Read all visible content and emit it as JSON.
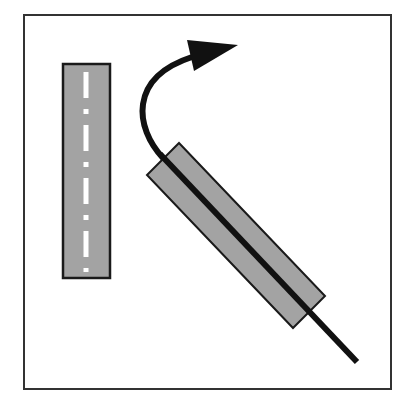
{
  "diagram": {
    "frame": {
      "x": 24,
      "y": 15,
      "width": 367,
      "height": 374,
      "stroke": "#333333",
      "stroke_width": 2
    },
    "colors": {
      "background": "#ffffff",
      "road_fill": "#a3a3a3",
      "road_stroke": "#1a1a1a",
      "center_marking": "#ffffff",
      "path_line": "#111111"
    },
    "straight_road": {
      "x": 63,
      "y": 64,
      "width": 47,
      "height": 214,
      "center_x": 86,
      "dashes": [
        {
          "y1": 72,
          "y2": 98
        },
        {
          "y1": 125,
          "y2": 151
        },
        {
          "y1": 178,
          "y2": 204
        },
        {
          "y1": 231,
          "y2": 257
        }
      ],
      "dots": [
        {
          "y1": 109,
          "y2": 114
        },
        {
          "y1": 162,
          "y2": 167
        },
        {
          "y1": 215,
          "y2": 220
        },
        {
          "y1": 268,
          "y2": 272
        }
      ]
    },
    "rotated_road": {
      "points": [
        [
          179,
          143
        ],
        [
          325,
          296
        ],
        [
          293,
          328
        ],
        [
          147,
          175
        ]
      ]
    },
    "path": {
      "curve": "M 163 158 C 135 128, 128 78, 192 57",
      "straight": {
        "x1": 160,
        "y1": 154,
        "x2": 357,
        "y2": 362
      },
      "stroke_width": 6
    },
    "arrowhead": {
      "points": [
        [
          187,
          40
        ],
        [
          238,
          45
        ],
        [
          194,
          71
        ]
      ]
    }
  }
}
